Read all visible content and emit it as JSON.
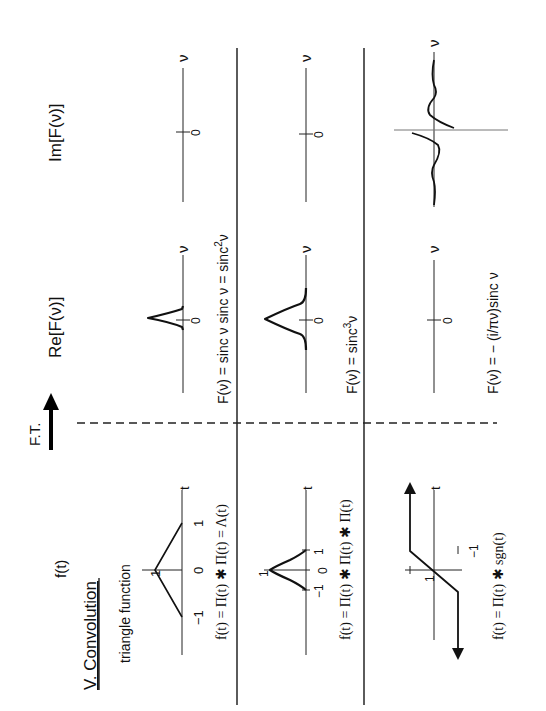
{
  "section_title": "V. Convolution",
  "columns": {
    "time": "f(t)",
    "transform_arrow": "F.T.",
    "real": "Re[F(ν)]",
    "imag": "Im[F(ν)]"
  },
  "rows": [
    {
      "name": "triangle",
      "caption_top": "triangle function",
      "time_formula": "f(t) = Π(t) ✱ Π(t) = Λ(t)",
      "time_ticks": {
        "neg": "−1",
        "zero": "0",
        "pos": "1",
        "peak": "1"
      },
      "time_axis_label": "t",
      "re_formula_prefix": "F(ν) = sinc ν  sinc ν  = sinc",
      "re_formula_sup": "2",
      "re_formula_suffix": "ν",
      "re_zero": "0",
      "re_axis_label": "ν",
      "im_zero": "0",
      "im_axis_label": "ν"
    },
    {
      "name": "triple-rect",
      "time_formula": "f(t) = Π(t) ✱ Π(t) ✱ Π(t)",
      "time_ticks": {
        "neg": "−1",
        "zero": "0",
        "pos": "1",
        "peak": "1"
      },
      "time_axis_label": "t",
      "re_formula_prefix": "F(ν) = sinc",
      "re_formula_sup": "3",
      "re_formula_suffix": "ν",
      "re_zero": "0",
      "re_axis_label": "ν",
      "im_zero": "0",
      "im_axis_label": "ν"
    },
    {
      "name": "rect-sgn",
      "time_formula": "f(t) = Π(t) ✱ sgn(t)",
      "time_ticks": {
        "pos": "1",
        "neg": "−1"
      },
      "time_axis_label": "t",
      "re_formula_prefix": "F(ν) = − (i/πν)sinc ν",
      "re_zero": "0",
      "re_axis_label": "ν",
      "im_axis_label": "ν"
    }
  ]
}
